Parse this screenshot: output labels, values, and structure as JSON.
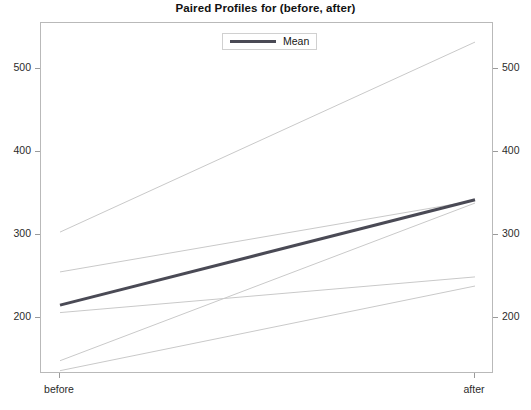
{
  "chart_data": {
    "type": "line",
    "title": "Paired Profiles for (before, after)",
    "xlabel": "",
    "ylabel": "",
    "categories": [
      "before",
      "after"
    ],
    "x_tick_labels": [
      "before",
      "after"
    ],
    "y_tick_labels": [
      "200",
      "300",
      "400",
      "500"
    ],
    "y_ticks": [
      200,
      300,
      400,
      500
    ],
    "ylim": [
      112,
      535
    ],
    "grid": false,
    "dual_y_axis": true,
    "right_y_tick_labels": [
      "200",
      "300",
      "400",
      "500"
    ],
    "legend": {
      "position": "top-center",
      "entries": [
        {
          "label": "Mean",
          "color": "#4a4a55",
          "width": 3
        }
      ]
    },
    "series": [
      {
        "name": "subject-1",
        "values": [
          283,
          512
        ],
        "color": "#c9c9c9",
        "kind": "profile"
      },
      {
        "name": "subject-2",
        "values": [
          235,
          321
        ],
        "color": "#c9c9c9",
        "kind": "profile"
      },
      {
        "name": "subject-3",
        "values": [
          186,
          229
        ],
        "color": "#c9c9c9",
        "kind": "profile"
      },
      {
        "name": "subject-4",
        "values": [
          128,
          318
        ],
        "color": "#c9c9c9",
        "kind": "profile"
      },
      {
        "name": "subject-5",
        "values": [
          116,
          218
        ],
        "color": "#c9c9c9",
        "kind": "profile"
      },
      {
        "name": "Mean",
        "values": [
          195,
          322
        ],
        "color": "#4a4a55",
        "kind": "mean"
      }
    ]
  },
  "chart": {
    "title": "Paired Profiles for (before, after)",
    "legend_label": "Mean",
    "x_labels": [
      "before",
      "after"
    ],
    "y_labels_left": [
      "500",
      "400",
      "300",
      "200"
    ],
    "y_labels_right": [
      "500",
      "400",
      "300",
      "200"
    ],
    "colors": {
      "mean_line": "#4a4a55",
      "profile_line": "#c9c9c9",
      "frame": "#b9b9b9",
      "text": "#1a1a1a"
    }
  }
}
